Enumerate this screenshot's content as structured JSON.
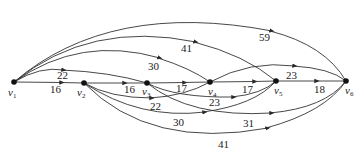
{
  "graph": {
    "nodes": [
      {
        "id": "v1",
        "label": "v",
        "sub": "1",
        "x": 14,
        "y": 82
      },
      {
        "id": "v2",
        "label": "v",
        "sub": "2",
        "x": 84,
        "y": 83
      },
      {
        "id": "v3",
        "label": "v",
        "sub": "3",
        "x": 147,
        "y": 83
      },
      {
        "id": "v4",
        "label": "v",
        "sub": "4",
        "x": 210,
        "y": 82
      },
      {
        "id": "v5",
        "label": "v",
        "sub": "5",
        "x": 276,
        "y": 81
      },
      {
        "id": "v6",
        "label": "v",
        "sub": "6",
        "x": 346,
        "y": 81
      }
    ],
    "edges": [
      {
        "from": "v1",
        "to": "v2",
        "weight": "16"
      },
      {
        "from": "v1",
        "to": "v3",
        "weight": "22"
      },
      {
        "from": "v1",
        "to": "v4",
        "weight": "30"
      },
      {
        "from": "v1",
        "to": "v5",
        "weight": "41"
      },
      {
        "from": "v1",
        "to": "v6",
        "weight": "59"
      },
      {
        "from": "v2",
        "to": "v3",
        "weight": "16"
      },
      {
        "from": "v2",
        "to": "v4",
        "weight": "22"
      },
      {
        "from": "v2",
        "to": "v5",
        "weight": "30"
      },
      {
        "from": "v2",
        "to": "v6",
        "weight": "41"
      },
      {
        "from": "v3",
        "to": "v4",
        "weight": "17"
      },
      {
        "from": "v3",
        "to": "v5",
        "weight": "23"
      },
      {
        "from": "v3",
        "to": "v6",
        "weight": "31"
      },
      {
        "from": "v4",
        "to": "v5",
        "weight": "17"
      },
      {
        "from": "v4",
        "to": "v6",
        "weight": "23"
      },
      {
        "from": "v5",
        "to": "v6",
        "weight": "18"
      }
    ]
  }
}
